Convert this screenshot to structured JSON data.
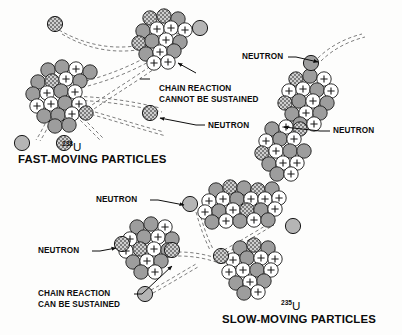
{
  "figure": {
    "background_color": "#fdfdfc",
    "ink_color": "#0d0d0d"
  },
  "panels": [
    {
      "id": "fast-moving",
      "caption": "FAST-MOVING PARTICLES",
      "isotope_mass": "238",
      "isotope_symbol": "U",
      "outcome": "CHAIN REACTION CANNOT BE SUSTAINED"
    },
    {
      "id": "slow-moving",
      "caption": "SLOW-MOVING PARTICLES",
      "isotope_mass": "235",
      "isotope_symbol": "U",
      "outcome": "CHAIN REACTION CAN BE SUSTAINED"
    }
  ],
  "labels": {
    "chain_reaction_cannot_line1": "CHAIN REACTION",
    "chain_reaction_cannot_line2": "CANNOT BE SUSTAINED",
    "chain_reaction_can_line1": "CHAIN REACTION",
    "chain_reaction_can_line2": "CAN BE SUSTAINED",
    "neutron": "NEUTRON",
    "neutron_top_right": "NEUTRON",
    "neutron_mid_right": "NEUTRON",
    "neutron_fast_right": "NEUTRON",
    "neutron_slow_top": "NEUTRON",
    "neutron_slow_left": "NEUTRON"
  },
  "legend_keys": {
    "proton": "proton (white circle with plus sign)",
    "neutron_bound": "bound neutron (gray shaded circle)",
    "neutron_free": "free neutron (cross-hatched circle)"
  },
  "colors": {
    "proton_fill": "#ffffff",
    "neutron_fill": "#9d9d9d",
    "neutron_fill_light": "#b5b5b5",
    "hatch_fill": "#8a8a8a",
    "outline": "#1a1a1a",
    "trajectory": "#6e6e6e"
  },
  "footnote": ""
}
